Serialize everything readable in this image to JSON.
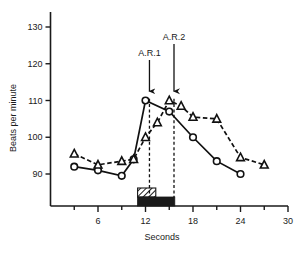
{
  "chart_data": {
    "type": "line",
    "title": "",
    "xlabel": "Seconds",
    "ylabel": "Beats  per  minute",
    "xlim": [
      0,
      30
    ],
    "ylim": [
      84,
      134
    ],
    "grid": false,
    "legend_position": "none",
    "x_major_ticks": [
      6,
      12,
      18,
      24,
      30
    ],
    "x_minor_ticks": [
      3,
      9,
      15,
      21,
      27
    ],
    "x_ticklabels": [
      "6",
      "12",
      "18",
      "24",
      "30"
    ],
    "y_ticks": [
      90,
      100,
      110,
      120,
      130
    ],
    "y_ticklabels": [
      "90",
      "100",
      "110",
      "120",
      "130"
    ],
    "series": [
      {
        "name": "circles",
        "marker": "open-circle",
        "linestyle": "solid",
        "x": [
          3,
          6,
          9,
          10.5,
          12,
          15,
          18,
          21,
          24
        ],
        "values": [
          92,
          91,
          89.5,
          94,
          110,
          107,
          100,
          93.5,
          90
        ]
      },
      {
        "name": "triangles",
        "marker": "open-triangle",
        "linestyle": "dashed",
        "x": [
          3,
          6,
          9,
          10.5,
          12,
          13.5,
          15,
          16.5,
          18,
          21,
          24,
          27
        ],
        "values": [
          95.5,
          92.5,
          93.5,
          94,
          100,
          104,
          110,
          108.5,
          105.5,
          105,
          94.5,
          92.5
        ]
      }
    ],
    "annotations": [
      {
        "label": "A.R.1",
        "x": 12.5,
        "type": "arrow-down"
      },
      {
        "label": "A.R.2",
        "x": 15.6,
        "type": "arrow-down"
      }
    ],
    "droplines": [
      {
        "x": 12.5
      },
      {
        "x": 15.6
      }
    ],
    "stimulus_bars": [
      {
        "name": "hatched-bar",
        "x_start": 11.0,
        "x_end": 13.3,
        "pattern": "hatched"
      },
      {
        "name": "solid-bar",
        "x_start": 11.0,
        "x_end": 15.7,
        "pattern": "solid"
      }
    ],
    "colors": {
      "ink": "#111111",
      "background": "#ffffff"
    }
  }
}
